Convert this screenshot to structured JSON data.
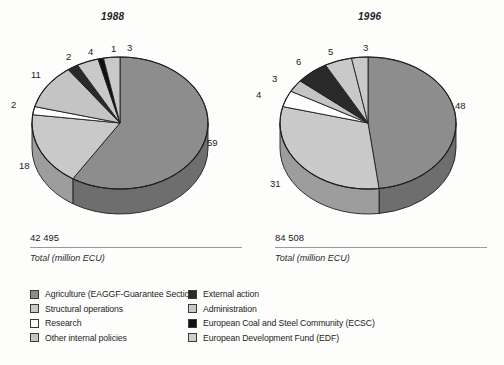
{
  "chart_data": [
    {
      "type": "pie",
      "title": "1988",
      "categories": [
        "Agriculture (EAGGF-Guarantee Section)",
        "Structural operations",
        "Research",
        "Other internal policies",
        "External action",
        "Administration",
        "European Coal and Steel Community (ECSC)",
        "European Development Fund (EDF)"
      ],
      "values": [
        59,
        18,
        2,
        11,
        2,
        4,
        1,
        3
      ],
      "value_labels": [
        "59",
        "18",
        "2",
        "11",
        "2",
        "4",
        "1",
        "3"
      ],
      "colors": [
        "#8d8d8d",
        "#c9c9c9",
        "#ffffff",
        "#c4c4c4",
        "#2a2a2a",
        "#c9c9c9",
        "#111111",
        "#c9c9c9"
      ],
      "total": "42 495",
      "total_caption": "Total (million ECU)",
      "units": "%",
      "legend_position": "bottom"
    },
    {
      "type": "pie",
      "title": "1996",
      "categories": [
        "Agriculture (EAGGF-Guarantee Section)",
        "Structural operations",
        "Research",
        "Other internal policies",
        "External action",
        "Administration",
        "European Coal and Steel Community (ECSC)",
        "European Development Fund (EDF)"
      ],
      "values": [
        48,
        31,
        4,
        3,
        6,
        5,
        0,
        3
      ],
      "value_labels": [
        "48",
        "31",
        "4",
        "3",
        "6",
        "5",
        "",
        "3"
      ],
      "colors": [
        "#8d8d8d",
        "#c9c9c9",
        "#ffffff",
        "#c4c4c4",
        "#2a2a2a",
        "#c9c9c9",
        "#111111",
        "#c9c9c9"
      ],
      "total": "84 508",
      "total_caption": "Total (million ECU)",
      "units": "%",
      "legend_position": "bottom"
    }
  ],
  "charts": {
    "c1988": {
      "title": "1988",
      "total": "42 495",
      "total_caption": "Total (million ECU)",
      "labels": {
        "agriculture": "59",
        "structural": "18",
        "research": "2",
        "other_internal": "11",
        "external_action": "2",
        "administration": "4",
        "ecsc": "1",
        "edf": "3"
      }
    },
    "c1996": {
      "title": "1996",
      "total": "84 508",
      "total_caption": "Total (million ECU)",
      "labels": {
        "agriculture": "48",
        "structural": "31",
        "research": "4",
        "other_internal": "3",
        "external_action": "6",
        "administration": "5",
        "edf": "3"
      }
    }
  },
  "legend": {
    "left": [
      {
        "label": "Agriculture (EAGGF-Guarantee Section)",
        "color": "#8d8d8d"
      },
      {
        "label": "Structural operations",
        "color": "#c9c9c9"
      },
      {
        "label": "Research",
        "color": "#ffffff"
      },
      {
        "label": "Other internal policies",
        "color": "#c4c4c4"
      }
    ],
    "right": [
      {
        "label": "External action",
        "color": "#2a2a2a"
      },
      {
        "label": "Administration",
        "color": "#c9c9c9"
      },
      {
        "label": "European Coal and Steel Community (ECSC)",
        "color": "#111111"
      },
      {
        "label": "European Development Fund (EDF)",
        "color": "#cfcfcf"
      }
    ]
  }
}
